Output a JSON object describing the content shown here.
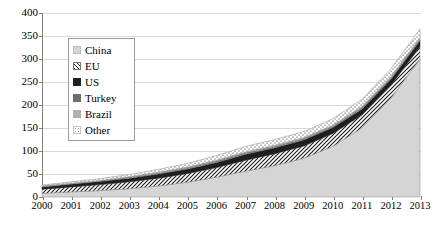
{
  "chart_data": {
    "type": "area",
    "title": "",
    "xlabel": "",
    "ylabel": "",
    "stacked": true,
    "grid": true,
    "legend_position": "inside-top-left",
    "ylim": [
      0,
      400
    ],
    "ytick_step": 50,
    "yticks": [
      "0",
      "50",
      "100",
      "150",
      "200",
      "250",
      "300",
      "350",
      "400"
    ],
    "categories": [
      "2000",
      "2001",
      "2002",
      "2003",
      "2004",
      "2005",
      "2006",
      "2007",
      "2008",
      "2009",
      "2010",
      "2011",
      "2012",
      "2013"
    ],
    "series": [
      {
        "name": "China",
        "pattern": "solid-light-gray",
        "color": "#d0d0d0",
        "values": [
          8,
          11,
          14,
          18,
          24,
          32,
          43,
          56,
          68,
          84,
          110,
          150,
          215,
          300
        ]
      },
      {
        "name": "EU",
        "pattern": "diagonal-hatch",
        "color": "#ffffff",
        "values": [
          9,
          11,
          13,
          15,
          17,
          19,
          21,
          24,
          26,
          27,
          28,
          28,
          28,
          27
        ]
      },
      {
        "name": "US",
        "pattern": "solid-black",
        "color": "#1a1a1a",
        "values": [
          5,
          6,
          7,
          8,
          9,
          10,
          11,
          13,
          13,
          13,
          13,
          13,
          13,
          13
        ]
      },
      {
        "name": "Turkey",
        "pattern": "solid-dark-gray",
        "color": "#707070",
        "values": [
          1,
          1,
          1,
          2,
          2,
          2,
          3,
          3,
          3,
          3,
          3,
          3,
          3,
          3
        ]
      },
      {
        "name": "Brazil",
        "pattern": "solid-mid-gray",
        "color": "#a8a8a8",
        "values": [
          1,
          1,
          1,
          1,
          2,
          2,
          2,
          2,
          2,
          2,
          2,
          3,
          3,
          3
        ]
      },
      {
        "name": "Other",
        "pattern": "dotted-light",
        "color": "#e6e6e6",
        "values": [
          2,
          3,
          4,
          5,
          6,
          8,
          10,
          12,
          13,
          13,
          14,
          15,
          17,
          19
        ]
      }
    ],
    "totals": [
      26,
      33,
      40,
      49,
      60,
      73,
      90,
      110,
      125,
      142,
      170,
      212,
      279,
      365
    ]
  },
  "legend": {
    "items": [
      {
        "label": "China"
      },
      {
        "label": "EU"
      },
      {
        "label": "US"
      },
      {
        "label": "Turkey"
      },
      {
        "label": "Brazil"
      },
      {
        "label": "Other"
      }
    ]
  }
}
